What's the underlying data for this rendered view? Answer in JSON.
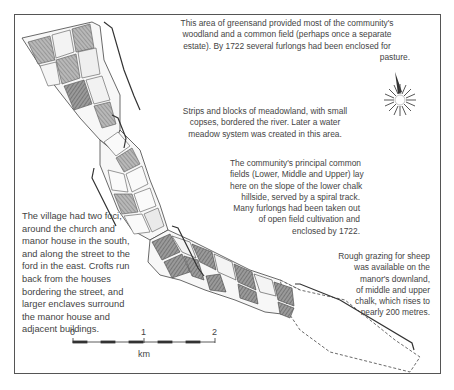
{
  "map": {
    "type": "historical estate map",
    "annotations": {
      "woodland": "This area of greensand provided most of the community's woodland and a common field (perhaps once a separate estate). By 1722 several furlongs had been enclosed for pasture.",
      "meadow": "Strips and  blocks of meadowland, with small copses, bordered the river. Later a water meadow system was created in this area.",
      "common_fields": "The community's principal common fields (Lower, Middle and Upper) lay here on the slope of the lower chalk hillside, served by a spiral track. Many furlongs had been taken out of open field cultivation and enclosed by 1722.",
      "village": "The village had two foci, around the church and manor house in the south, and along the street to the ford in the east. Crofts run back from the houses bordering the street, and larger enclaves surround the manor house and adjacent buildings.",
      "downland": "Rough grazing for sheep was available on the manor's downland, of middle and upper chalk, which rises to nearly 200 metres."
    },
    "annotation_lines": {
      "woodland": [
        "This area of greensand provided most of the community's",
        "woodland and a common field (perhaps once a separate",
        "estate). By 1722 several furlongs had been enclosed for",
        "pasture."
      ],
      "meadow": [
        "Strips and  blocks of meadowland, with small",
        "copses, bordered the river. Later a water",
        "meadow system was created in this area."
      ],
      "common_fields": [
        "The community's principal common",
        "fields (Lower, Middle and Upper) lay",
        "here on the slope of the lower chalk",
        "hillside, served by a spiral track.",
        "Many furlongs had been taken out",
        "of open field cultivation and",
        "enclosed by 1722."
      ],
      "village": [
        "The village had two foci,",
        "around the church and",
        "manor house in the south,",
        "and along the street to the",
        "ford in the east. Crofts run",
        "back from the houses",
        "bordering the street, and",
        "larger enclaves surround",
        "the manor house and",
        "adjacent buildings."
      ],
      "downland": [
        "Rough grazing for sheep",
        "was available on the",
        "manor's downland,",
        "of middle and upper",
        "chalk, which rises to",
        "nearly 200 metres."
      ]
    },
    "scale_bar": {
      "ticks": [
        "0",
        "1",
        "2"
      ],
      "unit": "km"
    },
    "compass": {
      "icon": "compass-rose-north-arrow"
    },
    "colors": {
      "frame": "#555555",
      "ink": "#3a3a3a",
      "field_shade": "#8a8a8a",
      "field_light": "#f4f4f4"
    }
  }
}
